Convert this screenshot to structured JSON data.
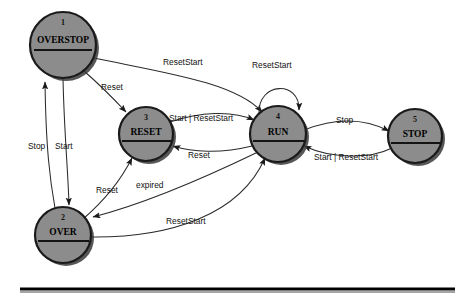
{
  "diagram": {
    "type": "state-machine",
    "title": "",
    "canvas": {
      "width": 470,
      "height": 298
    },
    "colors": {
      "state_fill": "#8c8c8c",
      "state_stroke": "#1a1a1a",
      "edge": "#2b2b2b",
      "text": "#111111",
      "background": "#ffffff"
    },
    "states": [
      {
        "id": "1",
        "number": "1",
        "label": "OVERSTOP",
        "cx": 63,
        "cy": 45,
        "r": 33
      },
      {
        "id": "2",
        "number": "2",
        "label": "OVER",
        "cx": 63,
        "cy": 235,
        "r": 28
      },
      {
        "id": "3",
        "number": "3",
        "label": "RESET",
        "cx": 146,
        "cy": 134,
        "r": 27
      },
      {
        "id": "4",
        "number": "4",
        "label": "RUN",
        "cx": 278,
        "cy": 134,
        "r": 28
      },
      {
        "id": "5",
        "number": "5",
        "label": "STOP",
        "cx": 415,
        "cy": 136,
        "r": 27
      }
    ],
    "transitions": [
      {
        "from": "1",
        "to": "4",
        "label": "ResetStart",
        "label_x": 163,
        "label_y": 63
      },
      {
        "from": "1",
        "to": "3",
        "label": "Reset",
        "label_x": 101,
        "label_y": 88
      },
      {
        "from": "2",
        "to": "1",
        "label": "Stop",
        "label_x": 28,
        "label_y": 147
      },
      {
        "from": "1",
        "to": "2",
        "label": "Start",
        "label_x": 55,
        "label_y": 147
      },
      {
        "from": "3",
        "to": "4",
        "label": "Start | ResetStart",
        "label_x": 169,
        "label_y": 119
      },
      {
        "from": "4",
        "to": "4",
        "label": "ResetStart",
        "label_x": 252,
        "label_y": 66
      },
      {
        "from": "4",
        "to": "3",
        "label": "Reset",
        "label_x": 188,
        "label_y": 156
      },
      {
        "from": "2",
        "to": "3",
        "label": "Reset",
        "label_x": 96,
        "label_y": 191
      },
      {
        "from": "4",
        "to": "2",
        "label": "expired",
        "label_x": 136,
        "label_y": 186
      },
      {
        "from": "2",
        "to": "4",
        "label": "ResetStart",
        "label_x": 166,
        "label_y": 222
      },
      {
        "from": "4",
        "to": "5",
        "label": "Stop",
        "label_x": 336,
        "label_y": 121
      },
      {
        "from": "5",
        "to": "4",
        "label": "Start | ResetStart",
        "label_x": 314,
        "label_y": 158
      }
    ],
    "footer_rule": {
      "x1": 20,
      "x2": 455,
      "y": 289
    }
  }
}
